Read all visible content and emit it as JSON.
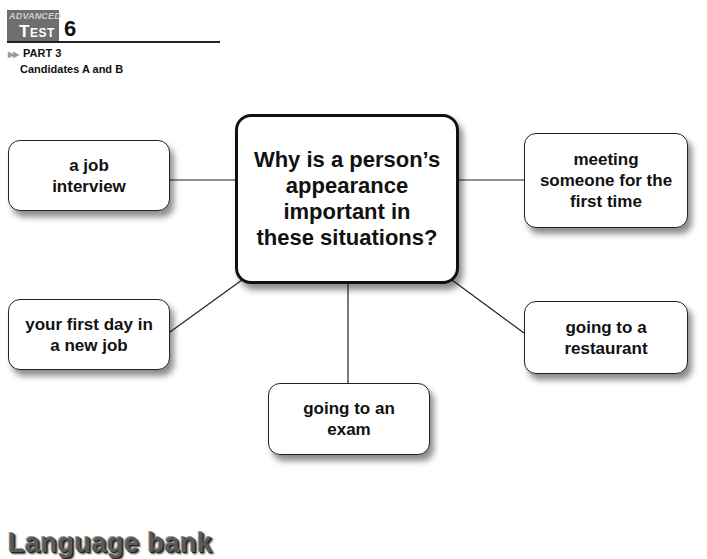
{
  "header": {
    "badge_level": "ADVANCED",
    "badge_label": "Test",
    "test_number": "6",
    "part": "PART 3",
    "candidates": "Candidates A and B"
  },
  "diagram": {
    "central_question": "Why is a person’s appearance important in these situations?",
    "prompts": [
      {
        "id": "top-left",
        "text": "a job interview"
      },
      {
        "id": "top-right",
        "text": "meeting someone for the first time"
      },
      {
        "id": "bottom-left",
        "text": "your first day in a new job"
      },
      {
        "id": "bottom-right",
        "text": "going to a restaurant"
      },
      {
        "id": "bottom-center",
        "text": "going to an exam"
      }
    ]
  },
  "footer": {
    "section_title": "Language bank"
  }
}
